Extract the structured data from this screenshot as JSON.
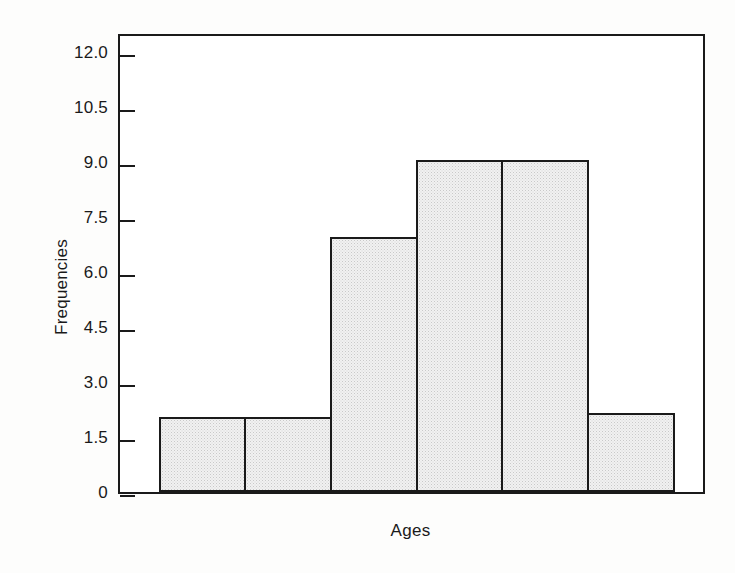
{
  "chart_data": {
    "type": "bar",
    "title": "",
    "subtitle": "",
    "xlabel": "Ages",
    "ylabel": "Frequencies",
    "categories": [
      "",
      "",
      "",
      "",
      "",
      ""
    ],
    "values": [
      2.0,
      2.0,
      6.9,
      9.0,
      9.0,
      2.1
    ],
    "series": [
      {
        "name": "Frequencies",
        "values": [
          2.0,
          2.0,
          6.9,
          9.0,
          9.0,
          2.1
        ]
      }
    ],
    "ylim": [
      0,
      12.55
    ],
    "xlim": [
      0,
      6.85
    ],
    "ytick_values": [
      0,
      1.5,
      3.0,
      4.5,
      6.0,
      7.5,
      9.0,
      10.5,
      12.0
    ],
    "ytick_labels": [
      "0",
      "1.5",
      "3.0",
      "4.5",
      "6.0",
      "7.5",
      "9.0",
      "10.5",
      "12.0"
    ],
    "xtick_values": [],
    "xtick_labels": [],
    "grid": false,
    "legend": false,
    "legend_position": "none",
    "bar_fill_color": "#f1f1f1",
    "bar_edge_color": "#1a1a1a",
    "axis_color": "#1a1a1a",
    "background_color": "#fdfdfc",
    "plot_background_color": "#ffffff",
    "annotations": []
  },
  "figure": {
    "caption": "",
    "axes_frame": "full-box"
  }
}
